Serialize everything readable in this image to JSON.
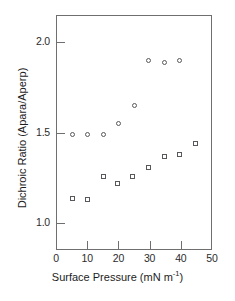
{
  "chart_data": {
    "type": "scatter",
    "title": "",
    "xlabel": "Surface Pressure (mN m-1)",
    "xlabel_prefix": "Surface Pressure (mN m",
    "xlabel_exponent": "-1",
    "xlabel_suffix": ")",
    "ylabel": "Dichroic Ratio (Apara/Aperp)",
    "xlim": [
      0,
      50
    ],
    "ylim": [
      0.85,
      2.15
    ],
    "xticks": [
      0,
      10,
      20,
      30,
      40,
      50
    ],
    "xtick_labels": [
      "0",
      "10",
      "20",
      "30",
      "40",
      "50"
    ],
    "yticks": [
      1.0,
      1.5,
      2.0
    ],
    "ytick_labels": [
      "1.0",
      "1.5",
      "2.0"
    ],
    "grid": false,
    "legend": "none",
    "marker_color": "#58585c",
    "axis_color": "#6f6f6f",
    "series": [
      {
        "name": "open circles",
        "marker": "circle",
        "x": [
          5,
          10,
          15,
          20,
          25,
          29.5,
          34.5,
          39.5
        ],
        "y": [
          1.49,
          1.49,
          1.49,
          1.55,
          1.65,
          1.9,
          1.89,
          1.9
        ]
      },
      {
        "name": "open squares",
        "marker": "square",
        "x": [
          5,
          10,
          15,
          19.5,
          24.5,
          29.5,
          34.5,
          39.5,
          44.5
        ],
        "y": [
          1.14,
          1.13,
          1.26,
          1.22,
          1.26,
          1.31,
          1.37,
          1.38,
          1.44
        ]
      }
    ]
  }
}
